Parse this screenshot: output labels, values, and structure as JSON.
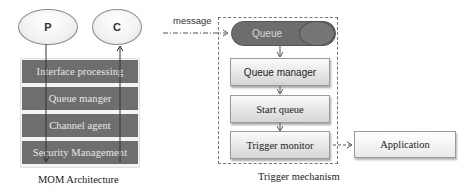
{
  "mom_architecture": {
    "caption": "MOM Architecture",
    "producer_label": "P",
    "consumer_label": "C",
    "layers": [
      "Interface processing",
      "Queue manger",
      "Channel agent",
      "Security Management"
    ]
  },
  "trigger_mechanism": {
    "caption": "Trigger mechanism",
    "incoming_label": "message",
    "queue_label": "Queue",
    "steps": [
      "Queue manager",
      "Start queue",
      "Trigger monitor"
    ],
    "output_label": "Application"
  },
  "colors": {
    "layer_fill": "#6e6e6e",
    "queue_fill": "#6d6d6d",
    "box_gradient_top": "#fbfbfb",
    "box_gradient_bottom": "#d5d5d5"
  }
}
